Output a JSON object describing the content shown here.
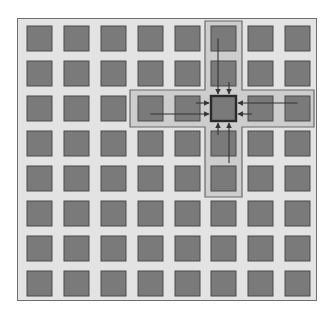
{
  "diagram": {
    "type": "grid-neighborhood",
    "rows": 8,
    "cols": 8,
    "center_cell": {
      "row": 2,
      "col": 5
    },
    "neighbors": [
      {
        "direction": "up",
        "cells": [
          {
            "row": 0,
            "col": 5
          },
          {
            "row": 1,
            "col": 5
          }
        ]
      },
      {
        "direction": "down",
        "cells": [
          {
            "row": 3,
            "col": 5
          },
          {
            "row": 4,
            "col": 5
          }
        ]
      },
      {
        "direction": "left",
        "cells": [
          {
            "row": 2,
            "col": 3
          },
          {
            "row": 2,
            "col": 4
          }
        ]
      },
      {
        "direction": "right",
        "cells": [
          {
            "row": 2,
            "col": 6
          },
          {
            "row": 2,
            "col": 7
          }
        ]
      }
    ],
    "colors": {
      "background": "#e3e3e3",
      "cell_fill": "#7a7a7a",
      "cell_border": "#4a4a4a",
      "band_fill": "#cdcdcd",
      "band_border": "#6a6a6a",
      "center_border": "#2a2a2a",
      "arrow": "#333333"
    }
  }
}
